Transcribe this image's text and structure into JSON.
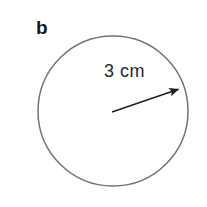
{
  "figure": {
    "part_label": "b",
    "background_color": "#ffffff",
    "width": 207,
    "height": 207
  },
  "circle": {
    "name": "circle-outline",
    "center_x": 113,
    "center_y": 111,
    "radius_px": 75,
    "stroke_color": "#737373",
    "stroke_width": 1.5,
    "fill": "none"
  },
  "radius_arrow": {
    "label": "3 cm",
    "value": 3,
    "unit": "cm",
    "stroke_color": "#1f1f1f",
    "stroke_width": 1.6,
    "start_x": 112,
    "start_y": 112,
    "end_x": 181,
    "end_y": 88,
    "arrowhead": "filled-triangle"
  },
  "icons": {
    "arrowhead": "arrow-head-icon"
  }
}
